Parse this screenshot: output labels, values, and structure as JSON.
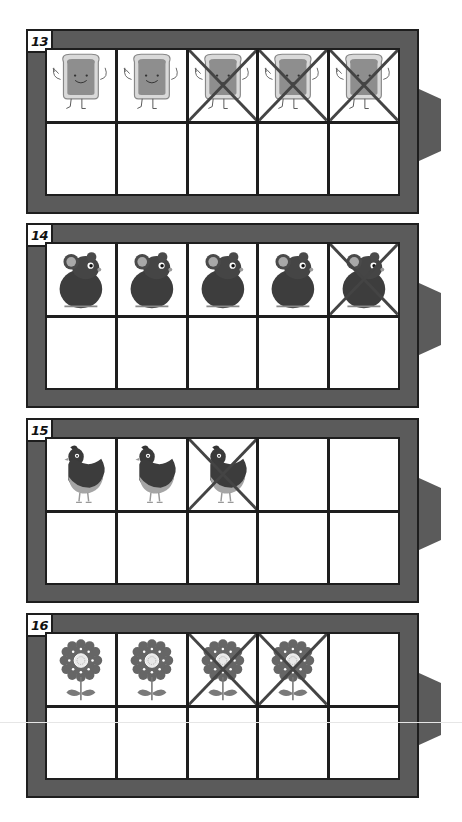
{
  "worksheet": {
    "colors": {
      "frame": "#5b5b5b",
      "frame_border": "#1e1e1e",
      "cell_bg": "#ffffff",
      "cross": "#444444"
    },
    "frames": [
      {
        "number": "13",
        "picture": "toast-icon",
        "pictures_shown": 5,
        "crossed_out": 3,
        "top_row": [
          "toast",
          "toast",
          "toast-crossed",
          "toast-crossed",
          "toast-crossed"
        ],
        "bottom_row": [
          "empty",
          "empty",
          "empty",
          "empty",
          "empty"
        ]
      },
      {
        "number": "14",
        "picture": "mouse-icon",
        "pictures_shown": 5,
        "crossed_out": 1,
        "top_row": [
          "mouse",
          "mouse",
          "mouse",
          "mouse",
          "mouse-crossed"
        ],
        "bottom_row": [
          "empty",
          "empty",
          "empty",
          "empty",
          "empty"
        ]
      },
      {
        "number": "15",
        "picture": "hen-icon",
        "pictures_shown": 3,
        "crossed_out": 1,
        "top_row": [
          "hen",
          "hen",
          "hen-crossed",
          "empty",
          "empty"
        ],
        "bottom_row": [
          "empty",
          "empty",
          "empty",
          "empty",
          "empty"
        ]
      },
      {
        "number": "16",
        "picture": "flower-icon",
        "pictures_shown": 4,
        "crossed_out": 2,
        "top_row": [
          "flower",
          "flower",
          "flower-crossed",
          "flower-crossed",
          "empty"
        ],
        "bottom_row": [
          "empty",
          "empty",
          "empty",
          "empty",
          "empty"
        ]
      }
    ]
  }
}
